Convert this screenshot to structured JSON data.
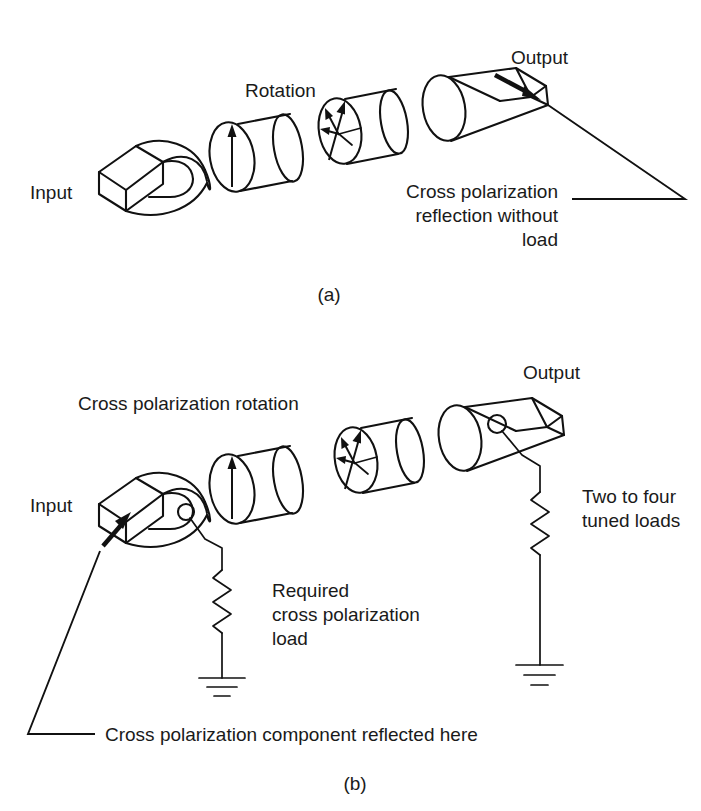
{
  "figure": {
    "background_color": "#ffffff",
    "line_color": "#111111",
    "text_color": "#1a1a1a"
  },
  "panel_a": {
    "caption": "(a)",
    "labels": {
      "input": "Input",
      "rotation": "Rotation",
      "output": "Output",
      "note_line1": "Cross polarization",
      "note_line2": "reflection without",
      "note_line3": "load"
    }
  },
  "panel_b": {
    "caption": "(b)",
    "labels": {
      "input": "Input",
      "cross_polarization_rotation": "Cross polarization rotation",
      "output": "Output",
      "two_to_four_line1": "Two to four",
      "two_to_four_line2": "tuned loads",
      "required_line1": "Required",
      "required_line2": "cross polarization",
      "required_line3": "load",
      "bottom_note": "Cross polarization component reflected here"
    }
  },
  "components": {
    "input_transition": "rectangular-to-circular-waveguide-transition",
    "rotation_section": "circular-waveguide-section-vertical-polarization",
    "cross_pol_section": "circular-waveguide-section-rotated-polarization",
    "output_transition": "circular-to-rectangular-waveguide-transition",
    "load": "resistor-to-ground",
    "port": "coupling-port-circle"
  }
}
